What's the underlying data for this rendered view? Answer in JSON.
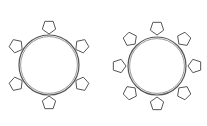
{
  "diagram": {
    "type": "seating-layout",
    "stroke_color": "#555555",
    "fill_color": "#ffffff",
    "tables": [
      {
        "name": "table-left",
        "shape": "circle",
        "cx": 49,
        "cy": 65,
        "r": 30,
        "chair_count": 6,
        "chair_distance": 38,
        "start_angle_deg": -90
      },
      {
        "name": "table-right",
        "shape": "circle",
        "cx": 157,
        "cy": 66,
        "r": 29,
        "chair_count": 8,
        "chair_distance": 38,
        "start_angle_deg": -90
      }
    ],
    "chair": {
      "shape": "pentagon",
      "radius": 7
    }
  }
}
